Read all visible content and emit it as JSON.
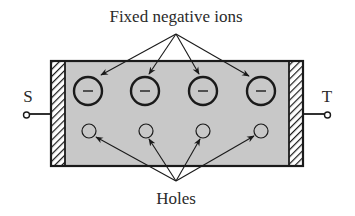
{
  "labels": {
    "top": "Fixed negative ions",
    "bottom": "Holes",
    "source": "S",
    "terminal": "T",
    "ion_sign": "−"
  },
  "colors": {
    "body_fill": "#c8c8c8",
    "stroke": "#1a1a1a",
    "background": "#ffffff"
  },
  "ions": [
    {
      "cx": 88,
      "cy": 91,
      "r": 14
    },
    {
      "cx": 145,
      "cy": 91,
      "r": 14
    },
    {
      "cx": 203,
      "cy": 91,
      "r": 14
    },
    {
      "cx": 261,
      "cy": 91,
      "r": 14
    }
  ],
  "holes": [
    {
      "cx": 89,
      "cy": 131,
      "r": 7
    },
    {
      "cx": 146,
      "cy": 131,
      "r": 7
    },
    {
      "cx": 203,
      "cy": 131,
      "r": 7
    },
    {
      "cx": 261,
      "cy": 131,
      "r": 7
    }
  ]
}
